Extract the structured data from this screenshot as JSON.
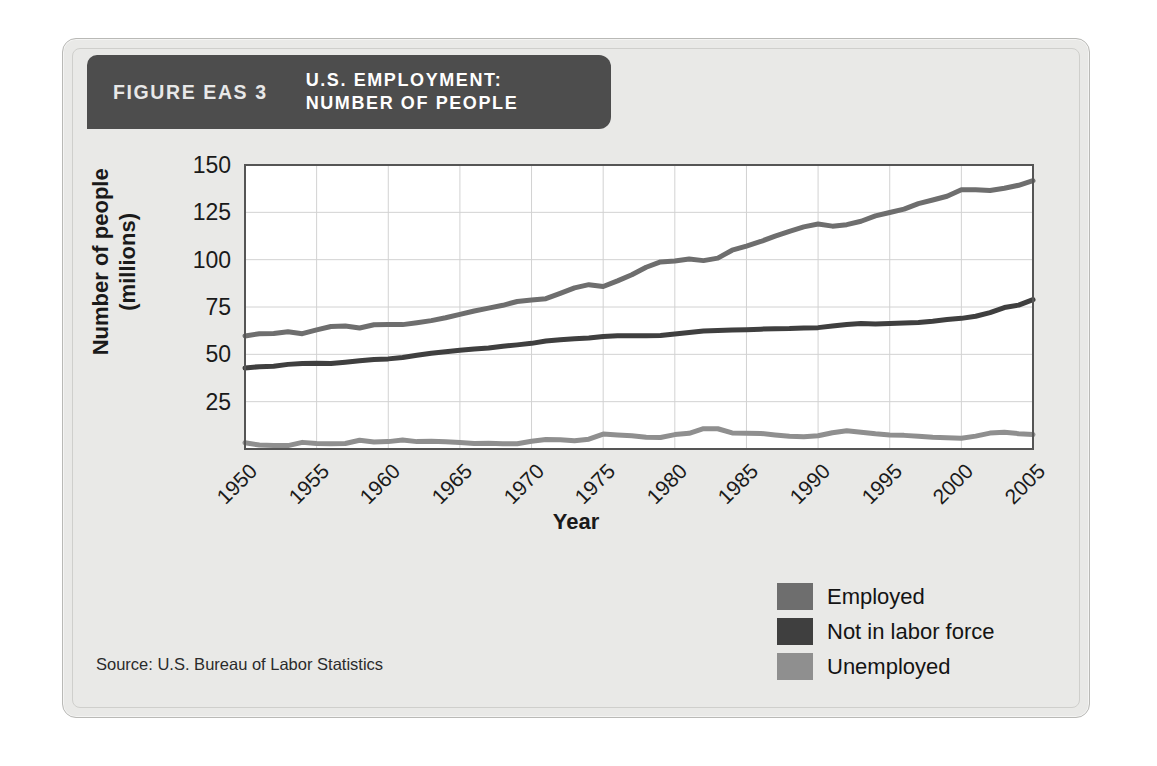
{
  "figure": {
    "number_label": "FIGURE EAS 3",
    "title": "U.S. EMPLOYMENT:\nNUMBER OF PEOPLE",
    "source": "Source: U.S. Bureau of Labor Statistics",
    "header_bg": "#4d4d4d",
    "card_bg": "#e9e9e7"
  },
  "legend": {
    "items": [
      {
        "label": "Employed",
        "color": "#6e6e6e"
      },
      {
        "label": "Not in labor force",
        "color": "#3f3f3f"
      },
      {
        "label": "Unemployed",
        "color": "#8f8f8f"
      }
    ]
  },
  "chart_data": {
    "type": "line",
    "title": "U.S. EMPLOYMENT: NUMBER OF PEOPLE",
    "xlabel": "Year",
    "ylabel": "Number of people\n(millions)",
    "xlim": [
      1950,
      2005
    ],
    "ylim": [
      0,
      150
    ],
    "yticks": [
      25,
      50,
      75,
      100,
      125,
      150
    ],
    "xticks": [
      1950,
      1955,
      1960,
      1965,
      1970,
      1975,
      1980,
      1985,
      1990,
      1995,
      2000,
      2005
    ],
    "grid": true,
    "legend_position": "bottom-right",
    "x": [
      1950,
      1951,
      1952,
      1953,
      1954,
      1955,
      1956,
      1957,
      1958,
      1959,
      1960,
      1961,
      1962,
      1963,
      1964,
      1965,
      1966,
      1967,
      1968,
      1969,
      1970,
      1971,
      1972,
      1973,
      1974,
      1975,
      1976,
      1977,
      1978,
      1979,
      1980,
      1981,
      1982,
      1983,
      1984,
      1985,
      1986,
      1987,
      1988,
      1989,
      1990,
      1991,
      1992,
      1993,
      1994,
      1995,
      1996,
      1997,
      1998,
      1999,
      2000,
      2001,
      2002,
      2003,
      2004,
      2005
    ],
    "series": [
      {
        "name": "Employed",
        "color": "#6e6e6e",
        "values": [
          59.7,
          60.9,
          61.0,
          61.9,
          60.9,
          62.9,
          64.7,
          65.0,
          63.9,
          65.6,
          65.8,
          65.7,
          66.7,
          67.8,
          69.3,
          71.1,
          72.9,
          74.4,
          75.9,
          77.9,
          78.7,
          79.4,
          82.2,
          85.1,
          86.8,
          85.8,
          88.8,
          92.0,
          96.0,
          98.8,
          99.3,
          100.4,
          99.5,
          100.8,
          105.0,
          107.2,
          109.6,
          112.4,
          115.0,
          117.3,
          118.8,
          117.7,
          118.5,
          120.3,
          123.1,
          124.9,
          126.7,
          129.6,
          131.5,
          133.5,
          136.9,
          136.9,
          136.5,
          137.7,
          139.3,
          141.7
        ]
      },
      {
        "name": "Not in labor force",
        "color": "#3f3f3f",
        "values": [
          42.8,
          43.5,
          43.7,
          44.7,
          45.2,
          45.3,
          45.1,
          45.8,
          46.6,
          47.3,
          47.6,
          48.3,
          49.5,
          50.6,
          51.4,
          52.1,
          52.8,
          53.3,
          54.3,
          55.0,
          55.8,
          57.0,
          57.7,
          58.2,
          58.6,
          59.4,
          59.8,
          59.8,
          59.8,
          60.0,
          60.8,
          61.5,
          62.3,
          62.6,
          62.8,
          63.0,
          63.3,
          63.5,
          63.6,
          63.9,
          64.1,
          65.0,
          65.8,
          66.3,
          66.0,
          66.3,
          66.6,
          66.8,
          67.5,
          68.4,
          69.0,
          70.1,
          72.0,
          74.7,
          76.0,
          78.9
        ]
      },
      {
        "name": "Unemployed",
        "color": "#8f8f8f",
        "values": [
          3.3,
          2.1,
          1.9,
          1.8,
          3.5,
          2.9,
          2.8,
          2.9,
          4.6,
          3.7,
          3.9,
          4.7,
          3.9,
          4.1,
          3.8,
          3.4,
          2.9,
          3.0,
          2.8,
          2.8,
          4.1,
          5.0,
          4.9,
          4.4,
          5.2,
          7.9,
          7.4,
          7.0,
          6.2,
          6.1,
          7.6,
          8.3,
          10.7,
          10.7,
          8.5,
          8.3,
          8.2,
          7.4,
          6.7,
          6.5,
          7.0,
          8.6,
          9.6,
          8.9,
          8.0,
          7.4,
          7.2,
          6.7,
          6.2,
          5.9,
          5.7,
          6.8,
          8.4,
          8.8,
          8.1,
          7.6
        ]
      }
    ]
  }
}
